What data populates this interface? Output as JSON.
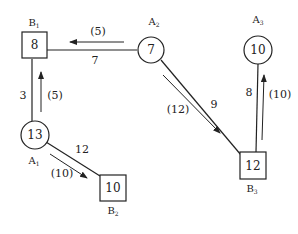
{
  "diagram": {
    "type": "transportation-network",
    "nodes": [
      {
        "id": "B1",
        "name": "B",
        "sub": "1",
        "shape": "square",
        "value": "8"
      },
      {
        "id": "A2",
        "name": "A",
        "sub": "2",
        "shape": "circle",
        "value": "7"
      },
      {
        "id": "A3",
        "name": "A",
        "sub": "3",
        "shape": "circle",
        "value": "10"
      },
      {
        "id": "A1",
        "name": "A",
        "sub": "1",
        "shape": "circle",
        "value": "13"
      },
      {
        "id": "B2",
        "name": "B",
        "sub": "2",
        "shape": "square",
        "value": "10"
      },
      {
        "id": "B3",
        "name": "B",
        "sub": "3",
        "shape": "square",
        "value": "12"
      }
    ],
    "edges": [
      {
        "from": "A2",
        "to": "B1",
        "cost": "7",
        "flow": "(5)"
      },
      {
        "from": "A1",
        "to": "B1",
        "cost": "3",
        "flow": "(5)"
      },
      {
        "from": "A1",
        "to": "B2",
        "cost": "12",
        "flow": "(10)"
      },
      {
        "from": "A2",
        "to": "B3",
        "cost": "9",
        "flow": "(12)"
      },
      {
        "from": "B3",
        "to": "A3",
        "cost": "8",
        "flow": "(10)"
      }
    ]
  }
}
